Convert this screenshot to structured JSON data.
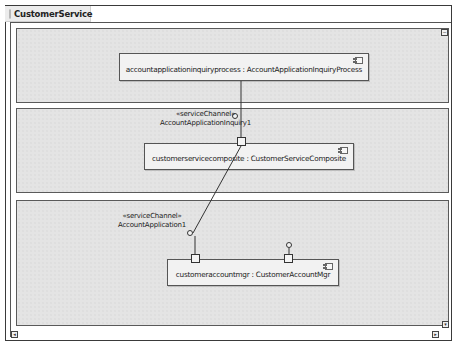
{
  "diagram": {
    "title": "CustomerService",
    "type": "composite structure"
  },
  "parts": [
    {
      "name": "accountapplicationinquiryprocess",
      "type": "AccountApplicationInquiryProcess",
      "label": "accountapplicationinquiryprocess : AccountApplicationInquiryProcess"
    },
    {
      "name": "customerservicecomposite",
      "type": "CustomerServiceComposite",
      "label": "customerservicecomposite : CustomerServiceComposite"
    },
    {
      "name": "customeraccountmgr",
      "type": "CustomerAccountMgr",
      "label": "customeraccountmgr : CustomerAccountMgr"
    }
  ],
  "channels": [
    {
      "stereotype": "«serviceChannel»",
      "name": "AccountApplicationInquiry1"
    },
    {
      "stereotype": "«serviceChannel»",
      "name": "AccountApplication1"
    }
  ],
  "controls": {
    "collapse_top": "−",
    "scroll_left": "◂",
    "scroll_right": "▸",
    "scroll_down": "▾"
  },
  "colors": {
    "lane_fill": "#e4e4e4",
    "part_fill": "#f2f2f2",
    "border": "#555555"
  }
}
